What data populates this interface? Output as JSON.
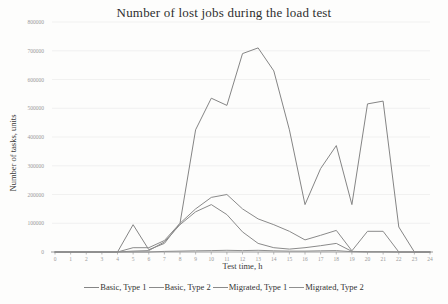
{
  "chart_data": {
    "type": "line",
    "title": "Number of lost jobs during the load test",
    "xlabel": "Test time, h",
    "ylabel": "Number of tasks, units",
    "xlim": [
      0,
      24
    ],
    "ylim": [
      0,
      800000
    ],
    "grid": true,
    "legend_position": "bottom",
    "x": [
      0,
      1,
      2,
      3,
      4,
      5,
      6,
      7,
      8,
      9,
      10,
      11,
      12,
      13,
      14,
      15,
      16,
      17,
      18,
      19,
      20,
      21,
      22,
      23,
      24
    ],
    "xticks": [
      0,
      1,
      2,
      3,
      4,
      5,
      6,
      7,
      8,
      9,
      10,
      11,
      12,
      13,
      14,
      15,
      16,
      17,
      18,
      19,
      20,
      21,
      22,
      23,
      24
    ],
    "yticks": [
      0,
      100000,
      200000,
      300000,
      400000,
      500000,
      600000,
      700000,
      800000
    ],
    "series": [
      {
        "name": "Basic, Type 1",
        "color": "#858585",
        "values": [
          0,
          0,
          0,
          0,
          0,
          95000,
          8000,
          30000,
          100000,
          425000,
          535000,
          510000,
          690000,
          710000,
          630000,
          425000,
          165000,
          290000,
          370000,
          165000,
          515000,
          525000,
          87000,
          0,
          0
        ]
      },
      {
        "name": "Basic, Type 2",
        "color": "#8a8a8a",
        "values": [
          0,
          0,
          0,
          0,
          0,
          15000,
          15000,
          40000,
          100000,
          150000,
          190000,
          200000,
          150000,
          115000,
          95000,
          72000,
          42000,
          58000,
          75000,
          4000,
          72000,
          72000,
          0,
          0,
          0
        ]
      },
      {
        "name": "Migrated, Type 1",
        "color": "#8a8a8a",
        "values": [
          0,
          0,
          0,
          0,
          0,
          3000,
          5000,
          35000,
          95000,
          140000,
          165000,
          130000,
          70000,
          30000,
          15000,
          10000,
          15000,
          22000,
          30000,
          2000,
          1000,
          1000,
          0,
          0,
          0
        ]
      },
      {
        "name": "Migrated, Type 2",
        "color": "#8f8f8f",
        "values": [
          0,
          0,
          0,
          0,
          0,
          0,
          0,
          2000,
          3000,
          4000,
          5000,
          6000,
          5000,
          6000,
          4000,
          3000,
          3000,
          4000,
          5000,
          1000,
          0,
          0,
          0,
          0,
          0
        ]
      }
    ],
    "colors": {
      "axis": "#9b9b9b",
      "tick_label": "#9a9a9a",
      "grid": "#ebebeb",
      "line": "#8a8a8a"
    }
  }
}
